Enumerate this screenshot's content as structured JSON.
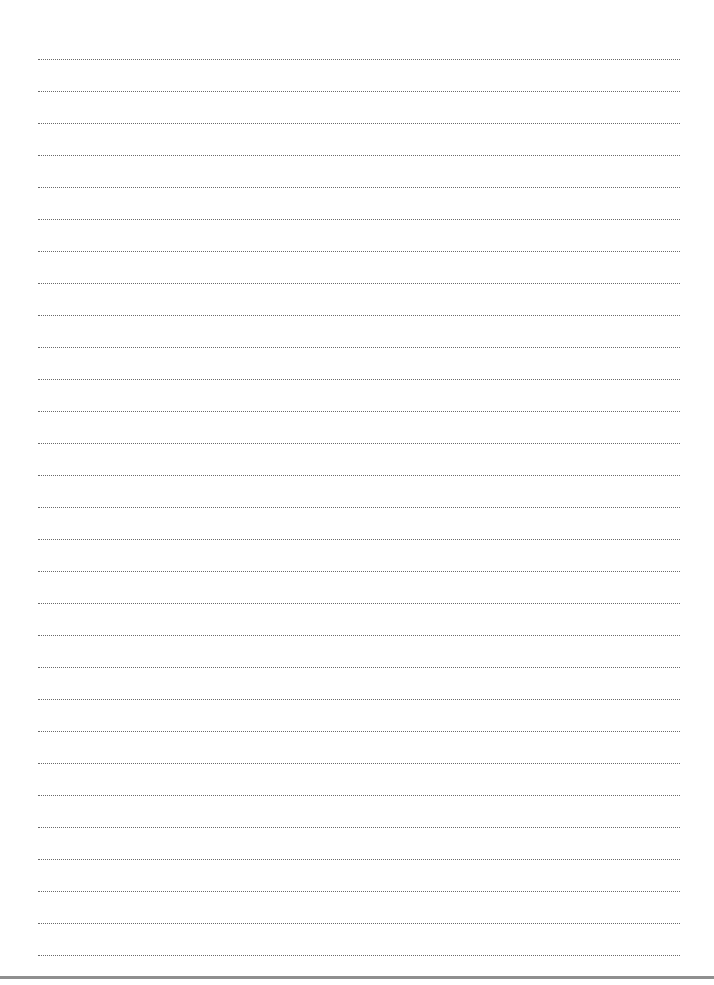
{
  "page": {
    "type": "lined-writing-sheet",
    "background": "#ffffff",
    "rule_style": "dotted",
    "rule_color": "#6a6a6a",
    "rule_count": 29,
    "first_rule_y": 59,
    "rule_spacing": 32,
    "rule_left": 38,
    "rule_right": 680,
    "bottom_bar_color": "#8f8f8f"
  }
}
